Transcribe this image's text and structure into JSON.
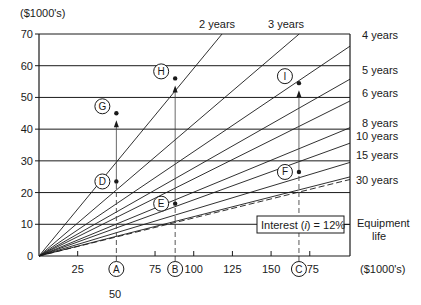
{
  "chart_data": {
    "type": "line",
    "title": "",
    "ylabel": "($1000's)",
    "xlabel": "($1000's)",
    "xlim": [
      0,
      201
    ],
    "ylim": [
      0,
      70
    ],
    "grid": "horizontal",
    "y_ticks": [
      0,
      10,
      20,
      30,
      40,
      50,
      60,
      70
    ],
    "x_ticks": [
      25,
      75,
      100,
      125,
      150,
      175
    ],
    "x_marker_labels": [
      {
        "label": "A",
        "x": 50,
        "value_label": "50"
      },
      {
        "label": "B",
        "x": 88
      },
      {
        "label": "C",
        "x": 168
      }
    ],
    "series": [
      {
        "name": "2 years",
        "slope": 0.5917,
        "style": "solid"
      },
      {
        "name": "3 years",
        "slope": 0.4163,
        "style": "solid"
      },
      {
        "name": "4 years",
        "slope": 0.3292,
        "style": "solid"
      },
      {
        "name": "5 years",
        "slope": 0.2774,
        "style": "solid"
      },
      {
        "name": "6 years",
        "slope": 0.2432,
        "style": "solid"
      },
      {
        "name": "8 years",
        "slope": 0.2013,
        "style": "solid"
      },
      {
        "name": "10 years",
        "slope": 0.177,
        "style": "solid"
      },
      {
        "name": "15 years",
        "slope": 0.1468,
        "style": "solid"
      },
      {
        "name": "30 years",
        "slope": 0.1241,
        "style": "solid"
      },
      {
        "name": "infinite",
        "slope": 0.12,
        "style": "dashed"
      }
    ],
    "points": [
      {
        "label": "D",
        "x": 50,
        "y": 23.5
      },
      {
        "label": "E",
        "x": 88,
        "y": 16.5
      },
      {
        "label": "F",
        "x": 168,
        "y": 26.5
      },
      {
        "label": "G",
        "x": 50,
        "y": 45
      },
      {
        "label": "H",
        "x": 88,
        "y": 56
      },
      {
        "label": "I",
        "x": 168,
        "y": 54.5
      }
    ],
    "arrows": [
      {
        "from": "A",
        "to": "G",
        "x": 50
      },
      {
        "from": "B",
        "to": "H",
        "x": 88
      },
      {
        "from": "C",
        "to": "I",
        "x": 168
      }
    ],
    "annotations": [
      "Interest (i) = 12%",
      "Equipment life"
    ]
  },
  "labels": {
    "y_unit": "($1000's)",
    "x_unit": "($1000's)",
    "top_lines": [
      "2 years",
      "3 years"
    ],
    "right_lines": [
      "4 years",
      "5 years",
      "6 years",
      "8 years",
      "10 years",
      "15 years",
      "30 years"
    ],
    "interest_prefix": "Interest (",
    "interest_var": "i",
    "interest_suffix": ") = 12%",
    "equipment": "Equipment",
    "life": "life",
    "fifty": "50"
  }
}
